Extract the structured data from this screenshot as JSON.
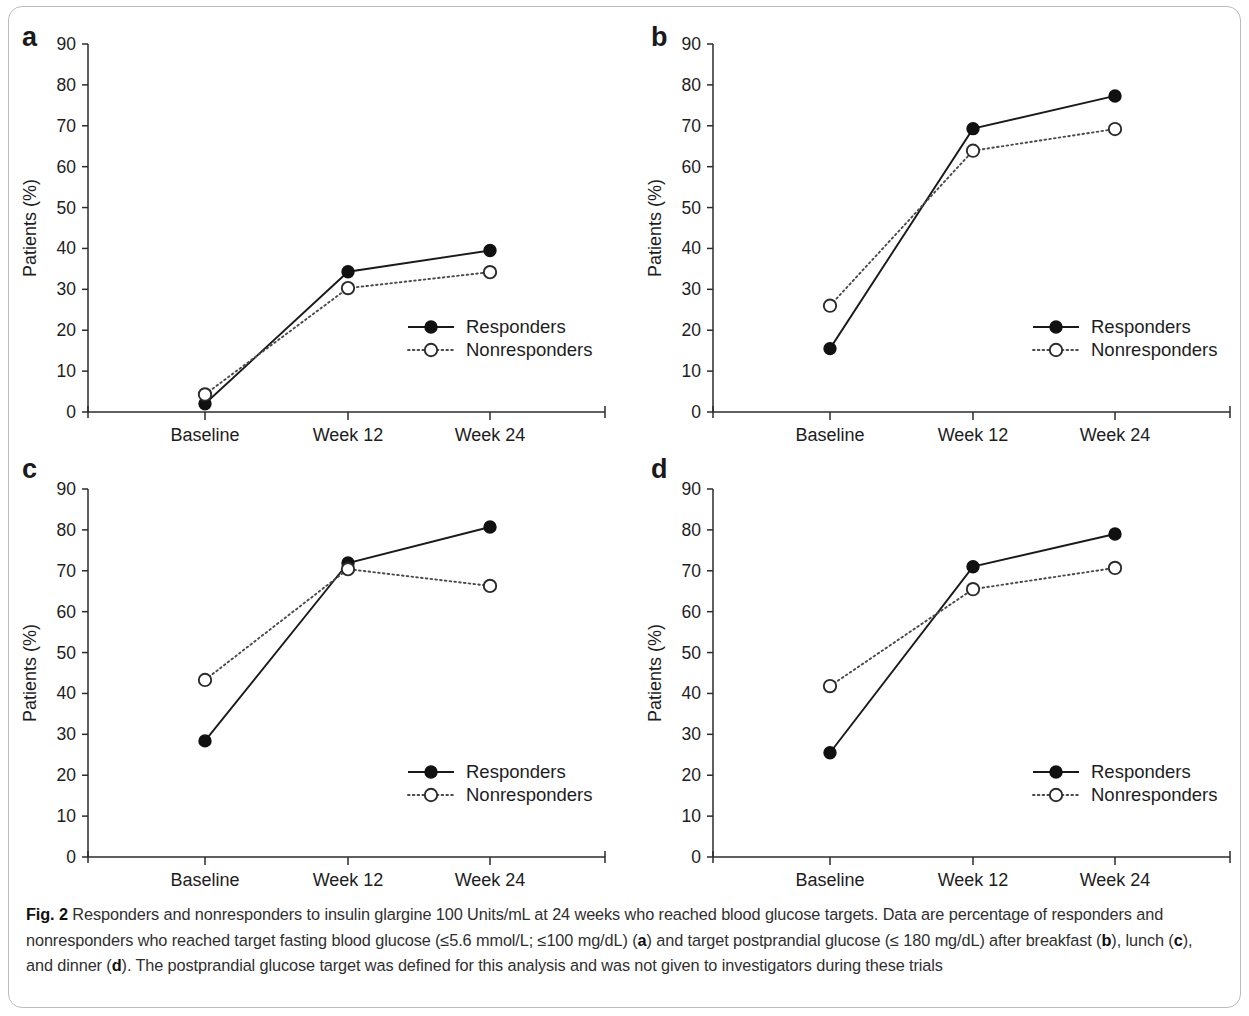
{
  "figure": {
    "label": "Fig. 2",
    "caption_segments": [
      {
        "text": "Fig. 2",
        "bold": true
      },
      {
        "text": " Responders and nonresponders to insulin glargine 100 Units/mL at 24 weeks who reached blood glucose targets. Data are percentage of responders and nonresponders who reached target fasting blood glucose (≤5.6 mmol/L; ≤100 mg/dL) (",
        "bold": false
      },
      {
        "text": "a",
        "bold": true
      },
      {
        "text": ") and target postprandial glucose (≤ 180 mg/dL) after breakfast (",
        "bold": false
      },
      {
        "text": "b",
        "bold": true
      },
      {
        "text": "), lunch (",
        "bold": false
      },
      {
        "text": "c",
        "bold": true
      },
      {
        "text": "), and dinner (",
        "bold": false
      },
      {
        "text": "d",
        "bold": true
      },
      {
        "text": "). The postprandial glucose target was defined for this analysis and was not given to investigators during these trials",
        "bold": false
      }
    ],
    "caption_plain": "Fig. 2 Responders and nonresponders to insulin glargine 100 Units/mL at 24 weeks who reached blood glucose targets. Data are percentage of responders and nonresponders who reached target fasting blood glucose (≤5.6 mmol/L; ≤100 mg/dL) (a) and target postprandial glucose (≤ 180 mg/dL) after breakfast (b), lunch (c), and dinner (d). The postprandial glucose target was defined for this analysis and was not given to investigators during these trials"
  },
  "colors": {
    "responders_line": "#1a1a1a",
    "nonresponders_line": "#4a4a4a",
    "axis": "#2b2b2b",
    "text": "#1d1d1d",
    "frame_border": "#b9bcc0",
    "background": "#ffffff"
  },
  "chart_data": [
    {
      "type": "line",
      "panel": "a",
      "panel_letter": "a",
      "title": "",
      "xlabel": "",
      "ylabel": "Patients (%)",
      "categories": [
        "Baseline",
        "Week 12",
        "Week 24"
      ],
      "yticks": [
        0,
        10,
        20,
        30,
        40,
        50,
        60,
        70,
        80,
        90
      ],
      "ylim": [
        0,
        90
      ],
      "grid": false,
      "legend_position": "center-right",
      "series": [
        {
          "name": "Responders",
          "values": [
            2.0,
            34.3,
            39.5
          ],
          "marker": "filled-circle",
          "line": "solid"
        },
        {
          "name": "Nonresponders",
          "values": [
            4.3,
            30.3,
            34.2
          ],
          "marker": "open-circle",
          "line": "dotted"
        }
      ]
    },
    {
      "type": "line",
      "panel": "b",
      "panel_letter": "b",
      "title": "",
      "xlabel": "",
      "ylabel": "Patients (%)",
      "categories": [
        "Baseline",
        "Week 12",
        "Week 24"
      ],
      "yticks": [
        0,
        10,
        20,
        30,
        40,
        50,
        60,
        70,
        80,
        90
      ],
      "ylim": [
        0,
        90
      ],
      "grid": false,
      "legend_position": "center-right",
      "series": [
        {
          "name": "Responders",
          "values": [
            15.5,
            69.3,
            77.3
          ],
          "marker": "filled-circle",
          "line": "solid"
        },
        {
          "name": "Nonresponders",
          "values": [
            26.0,
            63.9,
            69.2
          ],
          "marker": "open-circle",
          "line": "dotted"
        }
      ]
    },
    {
      "type": "line",
      "panel": "c",
      "panel_letter": "c",
      "title": "",
      "xlabel": "",
      "ylabel": "Patients (%)",
      "categories": [
        "Baseline",
        "Week 12",
        "Week 24"
      ],
      "yticks": [
        0,
        10,
        20,
        30,
        40,
        50,
        60,
        70,
        80,
        90
      ],
      "ylim": [
        0,
        90
      ],
      "grid": false,
      "legend_position": "center-right",
      "series": [
        {
          "name": "Responders",
          "values": [
            28.4,
            71.9,
            80.7
          ],
          "marker": "filled-circle",
          "line": "solid"
        },
        {
          "name": "Nonresponders",
          "values": [
            43.3,
            70.4,
            66.3
          ],
          "marker": "open-circle",
          "line": "dotted"
        }
      ]
    },
    {
      "type": "line",
      "panel": "d",
      "panel_letter": "d",
      "title": "",
      "xlabel": "",
      "ylabel": "Patients (%)",
      "categories": [
        "Baseline",
        "Week 12",
        "Week 24"
      ],
      "yticks": [
        0,
        10,
        20,
        30,
        40,
        50,
        60,
        70,
        80,
        90
      ],
      "ylim": [
        0,
        90
      ],
      "grid": false,
      "legend_position": "center-right",
      "series": [
        {
          "name": "Responders",
          "values": [
            25.5,
            71.0,
            79.0
          ],
          "marker": "filled-circle",
          "line": "solid"
        },
        {
          "name": "Nonresponders",
          "values": [
            41.8,
            65.5,
            70.7
          ],
          "marker": "open-circle",
          "line": "dotted"
        }
      ]
    }
  ],
  "layout": {
    "panel_boxes": [
      {
        "panel": "a",
        "left": 0,
        "top": 0,
        "width": 625,
        "height": 445,
        "letter_x": 22,
        "letter_y": 24
      },
      {
        "panel": "b",
        "left": 625,
        "top": 0,
        "width": 624,
        "height": 445,
        "letter_x": 26,
        "letter_y": 24
      },
      {
        "panel": "c",
        "left": 0,
        "top": 445,
        "width": 625,
        "height": 445,
        "letter_x": 22,
        "letter_y": 11
      },
      {
        "panel": "d",
        "left": 625,
        "top": 445,
        "width": 624,
        "height": 445,
        "letter_x": 26,
        "letter_y": 11
      }
    ],
    "plot_geom": {
      "ax_left": 88,
      "ax_right": 605,
      "ax_top": 44,
      "ax_bottom": 412,
      "cat_x": [
        205,
        348,
        490
      ],
      "legend_x": 408,
      "legend_y": 327,
      "legend_row_gap": 23
    }
  }
}
